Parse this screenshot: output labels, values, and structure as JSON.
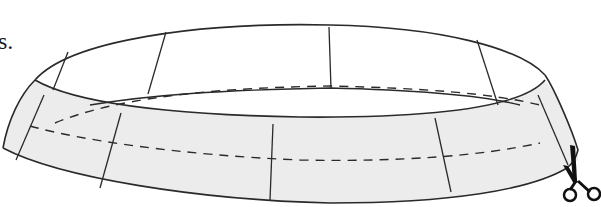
{
  "caption_fragment": "s.",
  "figure": {
    "colors": {
      "stroke": "#2a2a2a",
      "band_shade": "#e8e8e8",
      "background": "#ffffff"
    },
    "icons": [
      "scissors-icon"
    ]
  }
}
